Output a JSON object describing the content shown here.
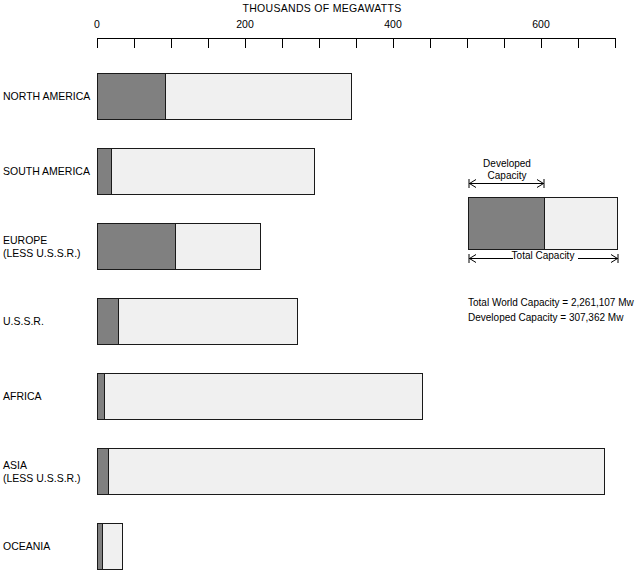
{
  "chart_data": {
    "type": "bar",
    "orientation": "horizontal",
    "title": "THOUSANDS OF MEGAWATTS",
    "xlabel": "THOUSANDS OF MEGAWATTS",
    "ylabel": "",
    "xlim": [
      0,
      700
    ],
    "grid": false,
    "legend_position": "right",
    "axis": {
      "tick_labels": [
        "0",
        "200",
        "400",
        "600"
      ],
      "labeled_ticks": [
        0,
        200,
        400,
        600
      ],
      "minor_tick_interval": 50,
      "all_ticks": [
        0,
        50,
        100,
        150,
        200,
        250,
        300,
        350,
        400,
        450,
        500,
        550,
        600,
        650,
        700
      ]
    },
    "categories": [
      "NORTH AMERICA",
      "SOUTH AMERICA",
      "EUROPE (LESS U.S.S.R.)",
      "U.S.S.R.",
      "AFRICA",
      "ASIA (LESS U.S.S.R.)",
      "OCEANIA"
    ],
    "series": [
      {
        "name": "Developed Capacity",
        "color": "#808080",
        "values": [
          92,
          19,
          106,
          28,
          9,
          15,
          7
        ]
      },
      {
        "name": "Total Capacity",
        "color": "#f0f0f0",
        "values": [
          345,
          294,
          222,
          272,
          441,
          686,
          35
        ]
      }
    ],
    "annotations": [
      "Total World Capacity  =  2,261,107 Mw",
      "Developed Capacity  =  307,362 Mw"
    ]
  },
  "title": "THOUSANDS OF MEGAWATTS",
  "axis": {
    "labels": [
      {
        "text": "0",
        "value": 0
      },
      {
        "text": "200",
        "value": 200
      },
      {
        "text": "400",
        "value": 400
      },
      {
        "text": "600",
        "value": 600
      }
    ]
  },
  "bars": [
    {
      "label_line1": "NORTH AMERICA",
      "label_line2": "",
      "developed": 92,
      "total": 345
    },
    {
      "label_line1": "SOUTH AMERICA",
      "label_line2": "",
      "developed": 19,
      "total": 294
    },
    {
      "label_line1": "EUROPE",
      "label_line2": "(LESS U.S.S.R.)",
      "developed": 106,
      "total": 222
    },
    {
      "label_line1": "U.S.S.R.",
      "label_line2": "",
      "developed": 28,
      "total": 272
    },
    {
      "label_line1": "AFRICA",
      "label_line2": "",
      "developed": 9,
      "total": 441
    },
    {
      "label_line1": "ASIA",
      "label_line2": "(LESS U.S.S.R.)",
      "developed": 15,
      "total": 686
    },
    {
      "label_line1": "OCEANIA",
      "label_line2": "",
      "developed": 7,
      "total": 35
    }
  ],
  "legend": {
    "developed_line1": "Developed",
    "developed_line2": "Capacity",
    "total_label": "Total Capacity"
  },
  "stats": {
    "total_world_capacity": "Total World Capacity  =  2,261,107 Mw",
    "developed_capacity": "Developed Capacity  =  307,362 Mw"
  },
  "colors": {
    "developed_fill": "#808080",
    "total_fill": "#f0f0f0",
    "outline": "#1a1a1a",
    "text": "#000000",
    "background": "#ffffff"
  }
}
